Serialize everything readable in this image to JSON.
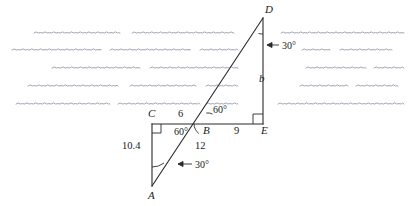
{
  "figure": {
    "background_color": "#ffffff",
    "line_color": "#2b2b2b",
    "wave_color": "#8b8ba0"
  },
  "vertices": [
    {
      "id": "A",
      "label": "A",
      "x": 152,
      "y": 186,
      "label_x": 148,
      "label_y": 199
    },
    {
      "id": "B",
      "label": "B",
      "x": 206,
      "y": 124,
      "label_x": 203,
      "label_y": 134
    },
    {
      "id": "C",
      "label": "C",
      "x": 152,
      "y": 124,
      "label_x": 148,
      "label_y": 117
    },
    {
      "id": "D",
      "label": "D",
      "x": 263,
      "y": 18,
      "label_x": 265,
      "label_y": 13
    },
    {
      "id": "E",
      "label": "E",
      "x": 263,
      "y": 124,
      "label_x": 261,
      "label_y": 134
    }
  ],
  "segments": [
    {
      "name": "segment-CE",
      "from": "C",
      "to": "E"
    },
    {
      "name": "segment-CA",
      "from": "C",
      "to": "A"
    },
    {
      "name": "segment-AD",
      "from": "A",
      "to": "D"
    },
    {
      "name": "segment-DE",
      "from": "D",
      "to": "E"
    }
  ],
  "length_labels": [
    {
      "name": "length-CB",
      "text": "6",
      "x": 178,
      "y": 117
    },
    {
      "name": "length-BE",
      "text": "9",
      "x": 234,
      "y": 134
    },
    {
      "name": "length-CA",
      "text": "10.4",
      "x": 122,
      "y": 149
    },
    {
      "name": "length-AB",
      "text": "12",
      "x": 195,
      "y": 149
    },
    {
      "name": "length-DE",
      "text": "b",
      "x": 259,
      "y": 82,
      "italic": true
    }
  ],
  "angle_labels": [
    {
      "name": "angle-at-D",
      "text": "30°",
      "x": 282,
      "y": 49
    },
    {
      "name": "angle-at-B-upper",
      "text": "60°",
      "x": 213,
      "y": 113
    },
    {
      "name": "angle-at-B-lower",
      "text": "60°",
      "x": 174,
      "y": 135
    },
    {
      "name": "angle-at-A",
      "text": "30°",
      "x": 195,
      "y": 168
    }
  ],
  "right_angles": [
    {
      "name": "right-angle-C",
      "x": 152,
      "y": 124
    },
    {
      "name": "right-angle-E",
      "x": 263,
      "y": 124
    }
  ],
  "waves": {
    "description": "wavy squiggle lines depicting water surface",
    "rows": [
      {
        "y": 33,
        "x1": 34,
        "x2": 120
      },
      {
        "y": 33,
        "x1": 132,
        "x2": 234
      },
      {
        "y": 33,
        "x1": 281,
        "x2": 404
      },
      {
        "y": 50,
        "x1": 12,
        "x2": 101
      },
      {
        "y": 50,
        "x1": 110,
        "x2": 190
      },
      {
        "y": 50,
        "x1": 200,
        "x2": 238
      },
      {
        "y": 50,
        "x1": 302,
        "x2": 330
      },
      {
        "y": 50,
        "x1": 340,
        "x2": 392
      },
      {
        "y": 68,
        "x1": 52,
        "x2": 140
      },
      {
        "y": 68,
        "x1": 150,
        "x2": 238
      },
      {
        "y": 68,
        "x1": 306,
        "x2": 366
      },
      {
        "y": 68,
        "x1": 374,
        "x2": 404
      },
      {
        "y": 86,
        "x1": 28,
        "x2": 118
      },
      {
        "y": 86,
        "x1": 130,
        "x2": 196
      },
      {
        "y": 86,
        "x1": 206,
        "x2": 238
      },
      {
        "y": 86,
        "x1": 300,
        "x2": 348
      },
      {
        "y": 86,
        "x1": 356,
        "x2": 398
      },
      {
        "y": 104,
        "x1": 16,
        "x2": 110
      },
      {
        "y": 104,
        "x1": 118,
        "x2": 200
      },
      {
        "y": 104,
        "x1": 206,
        "x2": 238
      },
      {
        "y": 104,
        "x1": 278,
        "x2": 404
      }
    ]
  }
}
